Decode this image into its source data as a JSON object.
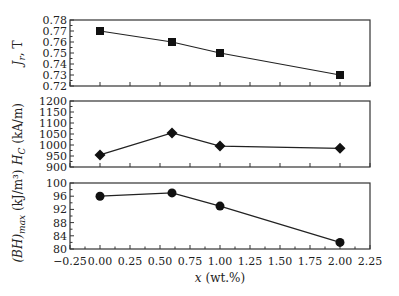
{
  "chart_data": [
    {
      "type": "line",
      "ylabel": "J_r, T",
      "marker": "square",
      "x": [
        0.0,
        0.6,
        1.0,
        2.0
      ],
      "values": [
        0.77,
        0.76,
        0.75,
        0.73
      ],
      "ylim": [
        0.72,
        0.78
      ],
      "yticks": [
        "0.72",
        "0.73",
        "0.74",
        "0.75",
        "0.76",
        "0.77",
        "0.78"
      ]
    },
    {
      "type": "line",
      "ylabel": "H_C (kA/m)",
      "marker": "diamond",
      "x": [
        0.0,
        0.6,
        1.0,
        2.0
      ],
      "values": [
        955,
        1055,
        995,
        985
      ],
      "ylim": [
        900,
        1200
      ],
      "yticks": [
        "900",
        "950",
        "1000",
        "1050",
        "1100",
        "1150",
        "1200"
      ]
    },
    {
      "type": "line",
      "ylabel": "(BH)_max (kJ/m³)",
      "marker": "circle",
      "x": [
        0.0,
        0.6,
        1.0,
        2.0
      ],
      "values": [
        96,
        97,
        93,
        82
      ],
      "ylim": [
        80,
        100
      ],
      "yticks": [
        "80",
        "84",
        "88",
        "92",
        "96",
        "100"
      ]
    }
  ],
  "xaxis": {
    "label": "x (wt.%)",
    "ticks": [
      "-0.25",
      "0.00",
      "0.25",
      "0.50",
      "0.75",
      "1.00",
      "1.25",
      "1.50",
      "1.75",
      "2.00",
      "2.25"
    ],
    "xlim": [
      -0.25,
      2.25
    ]
  }
}
